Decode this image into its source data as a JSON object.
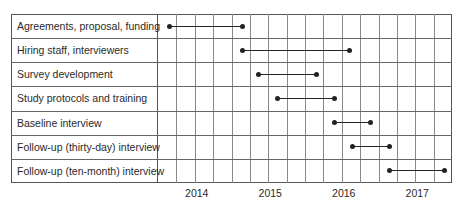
{
  "chart_data": {
    "type": "gantt",
    "title": "",
    "xlabel": "",
    "ylabel": "",
    "xlim": [
      2013.5,
      2017.5
    ],
    "grid": true,
    "grid_interval": "quarter",
    "x_ticks": [
      2014,
      2015,
      2016,
      2017
    ],
    "x_tick_labels": [
      "2014",
      "2015",
      "2016",
      "2017"
    ],
    "tasks": [
      {
        "label": "Agreements, proposal, funding",
        "start": 2013.66,
        "end": 2014.65
      },
      {
        "label": "Hiring staff, interviewers",
        "start": 2014.65,
        "end": 2016.1
      },
      {
        "label": "Survey development",
        "start": 2014.87,
        "end": 2015.65
      },
      {
        "label": "Study protocols and training",
        "start": 2015.13,
        "end": 2015.9
      },
      {
        "label": "Baseline interview",
        "start": 2015.9,
        "end": 2016.39
      },
      {
        "label": "Follow-up (thirty-day) interview",
        "start": 2016.14,
        "end": 2016.65
      },
      {
        "label": "Follow-up (ten-month) interview",
        "start": 2016.65,
        "end": 2017.4
      }
    ],
    "colors": {
      "bar": "#222222",
      "grid": "#8a8a8a",
      "border": "#555555"
    }
  }
}
